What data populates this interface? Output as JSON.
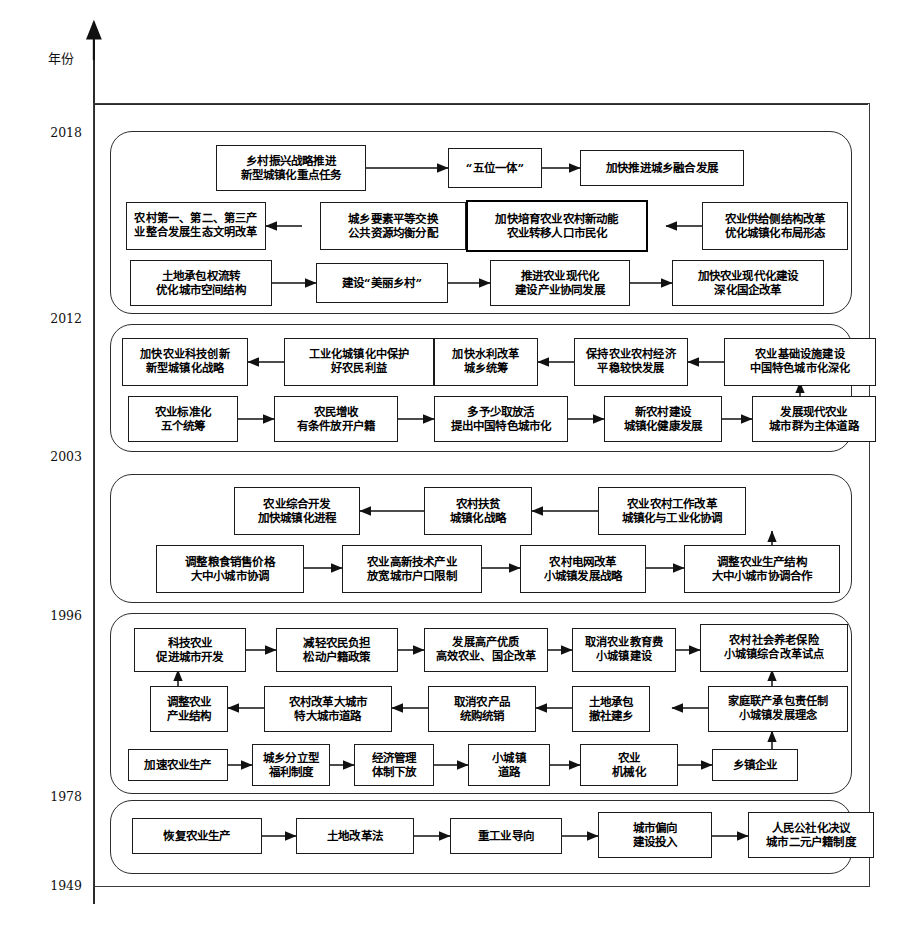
{
  "axis": {
    "vertical_axis_label": "年份",
    "year_ticks": [
      "2018",
      "2012",
      "2003",
      "1996",
      "1978",
      "1949"
    ]
  },
  "eras": [
    {
      "id": "era-2012-2018",
      "span": "2012-2018",
      "rows": [
        {
          "nodes": [
            {
              "text_lines": [
                "乡村振兴战略推进",
                "新型城镇化重点任务"
              ],
              "emphasis": false
            },
            {
              "text_lines": [
                "“五位一体”"
              ],
              "emphasis": false
            },
            {
              "text_lines": [
                "加快推进城乡融合发展"
              ],
              "emphasis": false
            }
          ]
        },
        {
          "nodes": [
            {
              "text_lines": [
                "农村第一、第二、第三产",
                "业整合发展生态文明改革"
              ],
              "emphasis": false
            },
            {
              "text_lines": [
                "城乡要素平等交换",
                "公共资源均衡分配"
              ],
              "emphasis": false
            },
            {
              "text_lines": [
                "加快培育农业农村新动能",
                "农业转移人口市民化"
              ],
              "emphasis": true
            },
            {
              "text_lines": [
                "农业供给侧结构改革",
                "优化城镇化布局形态"
              ],
              "emphasis": false
            }
          ]
        },
        {
          "nodes": [
            {
              "text_lines": [
                "土地承包权流转",
                "优化城市空间结构"
              ],
              "emphasis": false
            },
            {
              "text_lines": [
                "建设“美丽乡村”"
              ],
              "emphasis": false
            },
            {
              "text_lines": [
                "推进农业现代化",
                "建设产业协同发展"
              ],
              "emphasis": false
            },
            {
              "text_lines": [
                "加快农业现代化建设",
                "深化国企改革"
              ],
              "emphasis": false
            }
          ]
        }
      ]
    },
    {
      "id": "era-2003-2012",
      "span": "2003-2012",
      "rows": [
        {
          "nodes": [
            {
              "text_lines": [
                "加快农业科技创新",
                "新型城镇化战略"
              ],
              "emphasis": false
            },
            {
              "text_lines": [
                "工业化城镇化中保护",
                "好农民利益"
              ],
              "emphasis": false
            },
            {
              "text_lines": [
                "加快水利改革",
                "城乡统筹"
              ],
              "emphasis": false
            },
            {
              "text_lines": [
                "保持农业农村经济",
                "平稳较快发展"
              ],
              "emphasis": false
            },
            {
              "text_lines": [
                "农业基础设施建设",
                "中国特色城市化深化"
              ],
              "emphasis": false
            }
          ]
        },
        {
          "nodes": [
            {
              "text_lines": [
                "农业标准化",
                "五个统筹"
              ],
              "emphasis": false
            },
            {
              "text_lines": [
                "农民增收",
                "有条件放开户籍"
              ],
              "emphasis": false
            },
            {
              "text_lines": [
                "多予少取放活",
                "提出中国特色城市化"
              ],
              "emphasis": false
            },
            {
              "text_lines": [
                "新农村建设",
                "城镇化健康发展"
              ],
              "emphasis": false
            },
            {
              "text_lines": [
                "发展现代农业",
                "城市群为主体道路"
              ],
              "emphasis": false
            }
          ]
        }
      ]
    },
    {
      "id": "era-1996-2003",
      "span": "1996-2003",
      "rows": [
        {
          "nodes": [
            {
              "text_lines": [
                "农业综合开发",
                "加快城镇化进程"
              ],
              "emphasis": false
            },
            {
              "text_lines": [
                "农村扶贫",
                "城镇化战略"
              ],
              "emphasis": false
            },
            {
              "text_lines": [
                "农业农村工作改革",
                "城镇化与工业化协调"
              ],
              "emphasis": false
            }
          ]
        },
        {
          "nodes": [
            {
              "text_lines": [
                "调整粮食销售价格",
                "大中小城市协调"
              ],
              "emphasis": false
            },
            {
              "text_lines": [
                "农业高新技术产业",
                "放宽城市户口限制"
              ],
              "emphasis": false
            },
            {
              "text_lines": [
                "农村电网改革",
                "小城镇发展战略"
              ],
              "emphasis": false
            },
            {
              "text_lines": [
                "调整农业生产结构",
                "大中小城市协调合作"
              ],
              "emphasis": false
            }
          ]
        }
      ]
    },
    {
      "id": "era-1978-1996",
      "span": "1978-1996",
      "rows": [
        {
          "nodes": [
            {
              "text_lines": [
                "科技农业",
                "促进城市开发"
              ],
              "emphasis": false
            },
            {
              "text_lines": [
                "减轻农民负担",
                "松动户籍政策"
              ],
              "emphasis": false
            },
            {
              "text_lines": [
                "发展高产优质",
                "高效农业、国企改革"
              ],
              "emphasis": false
            },
            {
              "text_lines": [
                "取消农业教育费",
                "小城镇建设"
              ],
              "emphasis": false
            },
            {
              "text_lines": [
                "农村社会养老保险",
                "小城镇综合改革试点"
              ],
              "emphasis": false
            }
          ]
        },
        {
          "nodes": [
            {
              "text_lines": [
                "调整农业",
                "产业结构"
              ],
              "emphasis": false
            },
            {
              "text_lines": [
                "农村改革大城市",
                "特大城市道路"
              ],
              "emphasis": false
            },
            {
              "text_lines": [
                "取消农产品",
                "统购统销"
              ],
              "emphasis": false
            },
            {
              "text_lines": [
                "土地承包",
                "撤社建乡"
              ],
              "emphasis": false
            },
            {
              "text_lines": [
                "家庭联产承包责任制",
                "小城镇发展理念"
              ],
              "emphasis": false
            }
          ]
        },
        {
          "nodes": [
            {
              "text_lines": [
                "加速农业生产"
              ],
              "emphasis": false
            },
            {
              "text_lines": [
                "城乡分立型",
                "福利制度"
              ],
              "emphasis": false
            },
            {
              "text_lines": [
                "经济管理",
                "体制下放"
              ],
              "emphasis": false
            },
            {
              "text_lines": [
                "小城镇",
                "道路"
              ],
              "emphasis": false
            },
            {
              "text_lines": [
                "农业",
                "机械化"
              ],
              "emphasis": false
            },
            {
              "text_lines": [
                "乡镇企业"
              ],
              "emphasis": false
            }
          ]
        }
      ]
    },
    {
      "id": "era-1949-1978",
      "span": "1949-1978",
      "rows": [
        {
          "nodes": [
            {
              "text_lines": [
                "恢复农业生产"
              ],
              "emphasis": false
            },
            {
              "text_lines": [
                "土地改革法"
              ],
              "emphasis": false
            },
            {
              "text_lines": [
                "重工业导向"
              ],
              "emphasis": false
            },
            {
              "text_lines": [
                "城市偏向",
                "建设投入"
              ],
              "emphasis": false
            },
            {
              "text_lines": [
                "人民公社化决议",
                "城市二元户籍制度"
              ],
              "emphasis": false
            }
          ]
        }
      ]
    }
  ],
  "colors": {
    "line": "#2e2e2e",
    "box_border": "#1b1b1b",
    "emphasis_border": "#000000",
    "background": "#ffffff",
    "text": "#000000"
  }
}
